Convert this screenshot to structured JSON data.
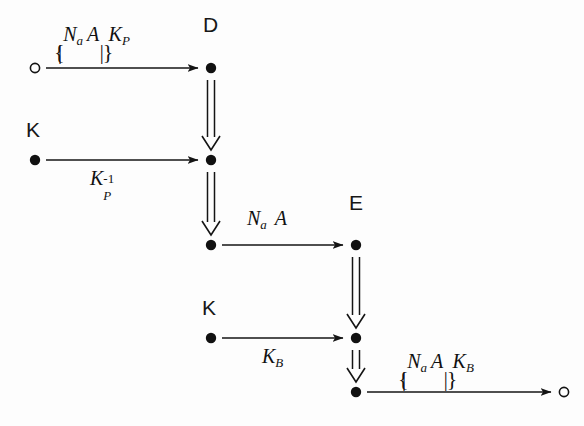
{
  "diagram": {
    "background_color": "#fdfdfd",
    "ink_color": "#141414",
    "strands": [
      {
        "id": "D",
        "name_label": "D",
        "name_x": 205,
        "name_y": 22
      },
      {
        "id": "E",
        "name_label": "E",
        "name_x": 350,
        "name_y": 200
      },
      {
        "id": "K1",
        "name_label": "K",
        "name_x": 27,
        "name_y": 127
      },
      {
        "id": "K2",
        "name_label": "K",
        "name_x": 203,
        "name_y": 305
      }
    ],
    "nodes": [
      {
        "id": "n-origin-top",
        "type": "open-circle",
        "x": 35,
        "y": 68
      },
      {
        "id": "n-d1",
        "type": "filled",
        "x": 211,
        "y": 68
      },
      {
        "id": "n-k1",
        "type": "filled",
        "x": 35,
        "y": 160
      },
      {
        "id": "n-d2",
        "type": "filled",
        "x": 211,
        "y": 160
      },
      {
        "id": "n-d3",
        "type": "filled",
        "x": 211,
        "y": 245
      },
      {
        "id": "n-e1",
        "type": "filled",
        "x": 356,
        "y": 245
      },
      {
        "id": "n-k2",
        "type": "filled",
        "x": 211,
        "y": 338
      },
      {
        "id": "n-e2",
        "type": "filled",
        "x": 356,
        "y": 338
      },
      {
        "id": "n-e3",
        "type": "filled",
        "x": 356,
        "y": 392
      },
      {
        "id": "n-terminal",
        "type": "open-circle",
        "x": 564,
        "y": 392
      }
    ],
    "message_arrows": [
      {
        "id": "msg-1",
        "from": "n-origin-top",
        "to": "n-d1",
        "x1": 46,
        "x2": 200,
        "y": 68,
        "label_id": "lbl-na-a-kp"
      },
      {
        "id": "msg-2",
        "from": "n-k1",
        "to": "n-d2",
        "x1": 46,
        "x2": 200,
        "y": 160,
        "label_id": "lbl-kp-inv"
      },
      {
        "id": "msg-3",
        "from": "n-d3",
        "to": "n-e1",
        "x1": 222,
        "x2": 345,
        "y": 245,
        "label_id": "lbl-na-a"
      },
      {
        "id": "msg-4",
        "from": "n-k2",
        "to": "n-e2",
        "x1": 222,
        "x2": 345,
        "y": 338,
        "label_id": "lbl-kb"
      },
      {
        "id": "msg-5",
        "from": "n-e3",
        "to": "n-terminal",
        "x1": 367,
        "x2": 553,
        "y": 392,
        "label_id": "lbl-na-a-kb"
      }
    ],
    "strand_arrows": [
      {
        "id": "strand-d-1",
        "x": 211,
        "y1": 80,
        "y2": 148
      },
      {
        "id": "strand-d-2",
        "x": 211,
        "y1": 172,
        "y2": 233
      },
      {
        "id": "strand-e-1",
        "x": 356,
        "y1": 257,
        "y2": 326
      },
      {
        "id": "strand-e-2",
        "x": 356,
        "y1": 350,
        "y2": 380
      }
    ],
    "labels": {
      "lbl-na-a-kp": {
        "text": "{|Na A|}KP",
        "body_n": "N",
        "body_n_sub": "a",
        "body_a": "A",
        "key": "K",
        "key_sub": "P",
        "x": 56,
        "y": 28
      },
      "lbl-kp-inv": {
        "text": "KP^-1",
        "key": "K",
        "key_sub": "P",
        "key_sup": "-1",
        "x": 92,
        "y": 172
      },
      "lbl-na-a": {
        "text": "Na A",
        "body_n": "N",
        "body_n_sub": "a",
        "body_a": "A",
        "x": 249,
        "y": 212
      },
      "lbl-kb": {
        "text": "KB",
        "key": "K",
        "key_sub": "B",
        "x": 264,
        "y": 350
      },
      "lbl-na-a-kb": {
        "text": "{|Na A|}KB",
        "body_n": "N",
        "body_n_sub": "a",
        "body_a": "A",
        "key": "K",
        "key_sub": "B",
        "x": 400,
        "y": 355
      }
    },
    "glyphs": {
      "brace_open": "{",
      "brace_close": "}",
      "vertical_bar": "|",
      "minus_one": "−1"
    }
  }
}
